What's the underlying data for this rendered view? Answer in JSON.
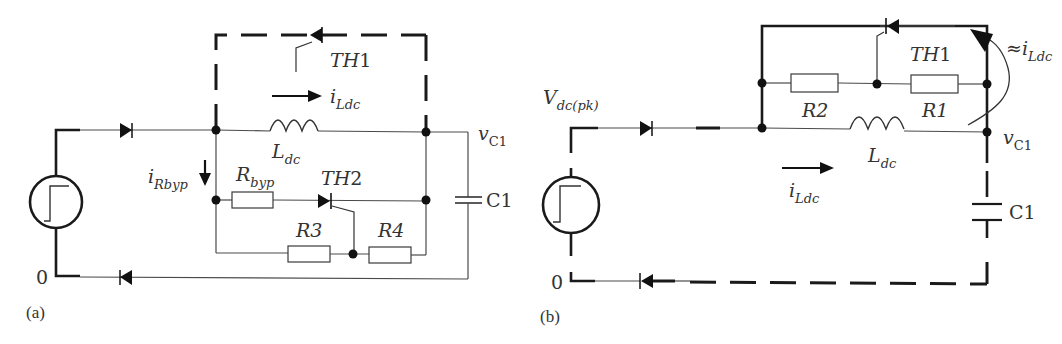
{
  "diagram_a": {
    "panel_label": "(a)",
    "ground_label": "0",
    "thyristor_1": {
      "name": "TH",
      "index": "1"
    },
    "thyristor_2": {
      "name": "TH",
      "index": "2"
    },
    "current_ldc": {
      "main": "i",
      "sub": "Ldc"
    },
    "current_rbyp": {
      "main": "i",
      "sub": "Rbyp"
    },
    "inductor": {
      "main": "L",
      "sub": "dc"
    },
    "bypass_resistor": {
      "main": "R",
      "sub": "byp"
    },
    "resistor_3": "R3",
    "resistor_4": "R4",
    "capacitor": "C1",
    "capacitor_voltage": {
      "main": "v",
      "sub": "C1"
    }
  },
  "diagram_b": {
    "panel_label": "(b)",
    "ground_label": "0",
    "source_voltage": {
      "main": "V",
      "sub": "dc(pk)"
    },
    "thyristor_1": {
      "name": "TH",
      "index": "1"
    },
    "resistor_1": "R1",
    "resistor_2": "R2",
    "inductor": {
      "main": "L",
      "sub": "dc"
    },
    "current_ldc": {
      "main": "i",
      "sub": "Ldc"
    },
    "approx_current": {
      "prefix": "≈",
      "main": "i",
      "sub": "Ldc"
    },
    "capacitor": "C1",
    "capacitor_voltage": {
      "main": "v",
      "sub": "C1"
    }
  },
  "colors": {
    "ink": "#1a1a1a",
    "thin_wire": "#4a4a4a",
    "text": "#333333",
    "background": "#ffffff"
  }
}
